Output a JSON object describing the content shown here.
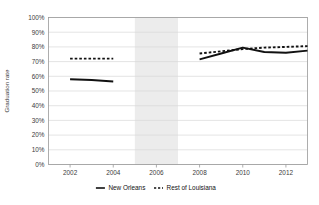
{
  "chart_data": {
    "type": "line",
    "title": "",
    "subtitle": "",
    "xlabel": "",
    "ylabel": "Graduation rate",
    "xlim": [
      2001,
      2013
    ],
    "ylim": [
      0,
      1
    ],
    "grid": true,
    "legend_position": "bottom",
    "x_ticks": [
      "2002",
      "2004",
      "2006",
      "2008",
      "2010",
      "2012"
    ],
    "x_tick_values": [
      2002,
      2004,
      2006,
      2008,
      2010,
      2012
    ],
    "y_ticks": [
      "0%",
      "10%",
      "20%",
      "30%",
      "40%",
      "50%",
      "60%",
      "70%",
      "80%",
      "90%",
      "100%"
    ],
    "y_tick_values": [
      0,
      0.1,
      0.2,
      0.3,
      0.4,
      0.5,
      0.6,
      0.7,
      0.8,
      0.9,
      1.0
    ],
    "annotations": [
      {
        "name": "katrina-gap-band",
        "type": "vertical-band",
        "x_start": 2005,
        "x_end": 2007,
        "color": "#ececec"
      }
    ],
    "series": [
      {
        "name": "New Orleans",
        "style": "solid",
        "color": "#111111",
        "x": [
          2002,
          2003,
          2004,
          2008,
          2009,
          2010,
          2011,
          2012,
          2013
        ],
        "values": [
          0.58,
          0.575,
          0.565,
          0.715,
          0.755,
          0.795,
          0.765,
          0.76,
          0.775
        ]
      },
      {
        "name": "Rest of Louisiana",
        "style": "dashed",
        "color": "#111111",
        "x": [
          2002,
          2003,
          2004,
          2008,
          2009,
          2010,
          2011,
          2012,
          2013
        ],
        "values": [
          0.72,
          0.72,
          0.72,
          0.755,
          0.77,
          0.785,
          0.795,
          0.8,
          0.805
        ]
      }
    ]
  },
  "legend": {
    "items": [
      {
        "label": "New Orleans",
        "style": "solid"
      },
      {
        "label": "Rest of Louisiana",
        "style": "dashed"
      }
    ]
  },
  "axes": {
    "y_title": "Graduation rate"
  }
}
